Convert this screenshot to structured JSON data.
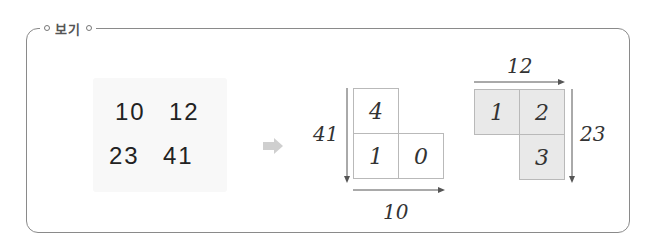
{
  "box": {
    "title": "보기"
  },
  "numbers": {
    "row1": [
      "10",
      "12"
    ],
    "row2": [
      "23",
      "41"
    ]
  },
  "arrow": {
    "icon": "right-arrow-icon",
    "color": "#cfcfcf"
  },
  "diagram_left": {
    "cells": [
      "4",
      "1",
      "0"
    ],
    "vertical_label": "41",
    "horizontal_label": "10"
  },
  "diagram_right": {
    "cells": [
      "1",
      "2",
      "3"
    ],
    "horizontal_label": "12",
    "vertical_label": "23",
    "shade_color": "#e9e9e9"
  }
}
